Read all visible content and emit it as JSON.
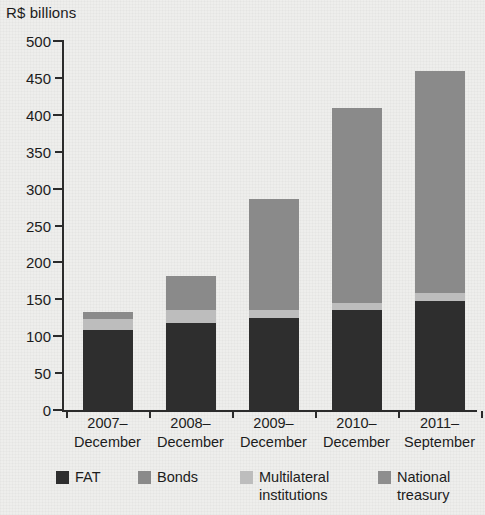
{
  "chart_data": {
    "type": "bar",
    "stacked": true,
    "title": "",
    "subtitle": "",
    "xlabel": "",
    "ylabel": "R$ billions",
    "ylim": [
      0,
      500
    ],
    "ytick_step": 50,
    "yticks": [
      "0",
      "50",
      "100",
      "150",
      "200",
      "250",
      "300",
      "350",
      "400",
      "450",
      "500"
    ],
    "grid": false,
    "legend_position": "bottom",
    "categories": [
      "2007–\nDecember",
      "2008–\nDecember",
      "2009–\nDecember",
      "2010–\nDecember",
      "2011–\nSeptember"
    ],
    "category_lines": [
      [
        "2007–",
        "December"
      ],
      [
        "2008–",
        "December"
      ],
      [
        "2009–",
        "December"
      ],
      [
        "2010–",
        "December"
      ],
      [
        "2011–",
        "September"
      ]
    ],
    "series": [
      {
        "name": "FAT",
        "color": "#2e2e2e",
        "values": [
          108,
          118,
          125,
          135,
          148
        ]
      },
      {
        "name": "Multilateral institutions",
        "color": "#bdbdbd",
        "values": [
          16,
          17,
          10,
          10,
          11
        ]
      },
      {
        "name": "Bonds",
        "color": "#8a8a8a",
        "values": [
          9,
          47,
          151,
          264,
          301
        ]
      },
      {
        "name": "National treasury",
        "color": "#8e8e8e",
        "values": [
          0,
          0,
          0,
          0,
          0
        ]
      }
    ],
    "totals": [
      133,
      182,
      286,
      409,
      460
    ]
  },
  "legend": {
    "items": [
      {
        "label": "FAT",
        "color": "#2e2e2e"
      },
      {
        "label": "Bonds",
        "color": "#8a8a8a"
      },
      {
        "label": "Multilateral\ninstitutions",
        "color": "#bdbdbd"
      },
      {
        "label": "National\ntreasury",
        "color": "#8e8e8e"
      }
    ]
  },
  "colors": {
    "background": "#eeeeec",
    "axis": "#2b2b2b",
    "text": "#1c1c1c"
  }
}
